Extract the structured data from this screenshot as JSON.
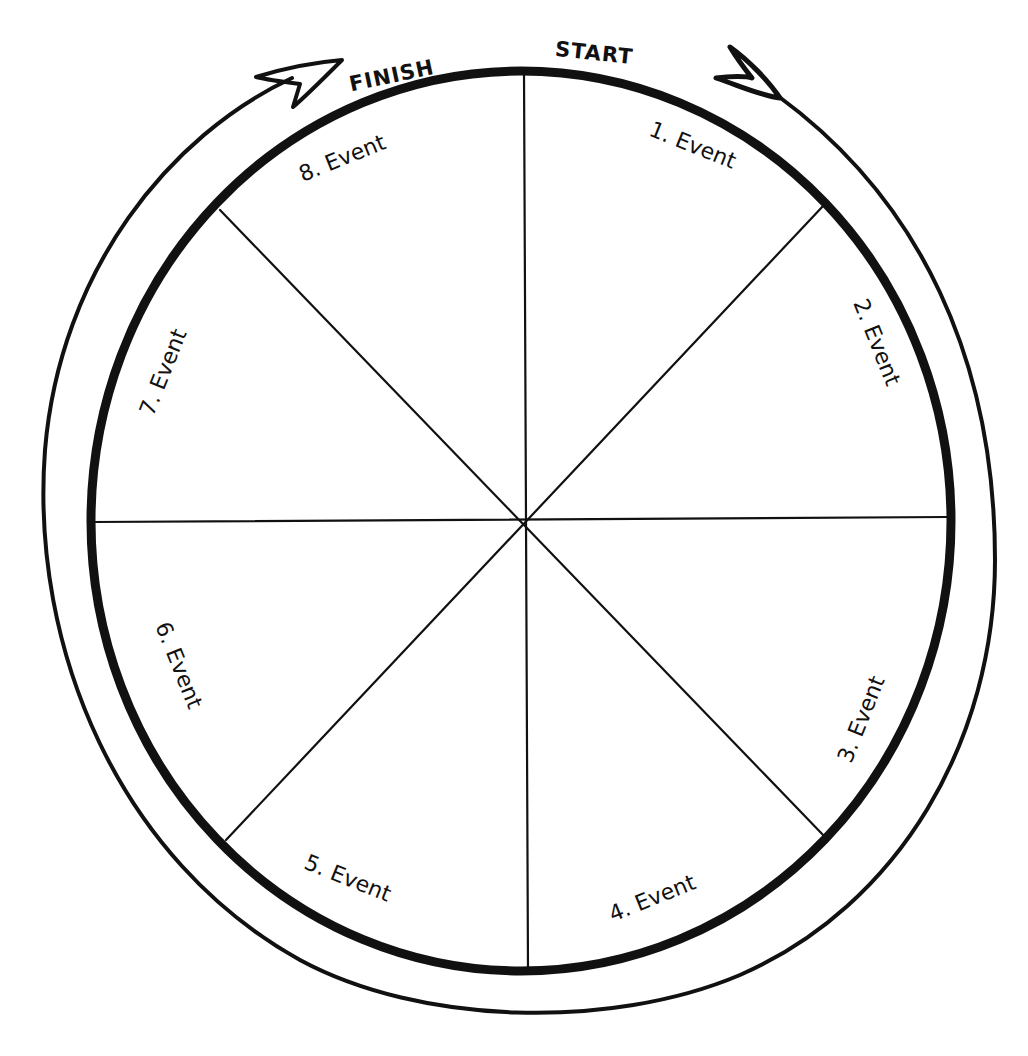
{
  "diagram": {
    "type": "circular-sequence-wheel",
    "segments": 8,
    "start_label": "START",
    "finish_label": "FINISH",
    "events": [
      {
        "label": "1. Event",
        "x": 690,
        "y": 152,
        "rotate": 22
      },
      {
        "label": "2. Event",
        "x": 870,
        "y": 345,
        "rotate": 68
      },
      {
        "label": "3. Event",
        "x": 868,
        "y": 722,
        "rotate": -68
      },
      {
        "label": "4. Event",
        "x": 655,
        "y": 905,
        "rotate": -22
      },
      {
        "label": "5. Event",
        "x": 345,
        "y": 885,
        "rotate": 22
      },
      {
        "label": "6. Event",
        "x": 172,
        "y": 668,
        "rotate": 68
      },
      {
        "label": "7. Event",
        "x": 170,
        "y": 375,
        "rotate": -68
      },
      {
        "label": "8. Event",
        "x": 345,
        "y": 165,
        "rotate": -22
      }
    ],
    "colors": {
      "ink": "#111111",
      "background": "#ffffff"
    }
  }
}
